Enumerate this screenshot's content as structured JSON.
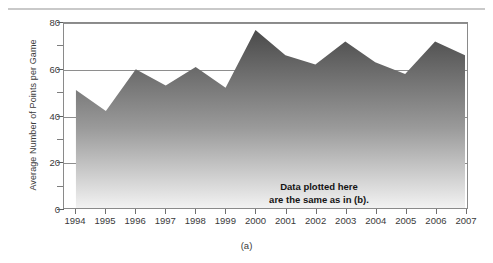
{
  "figure": {
    "caption": "(a)",
    "annotation_lines": [
      "Data plotted here",
      "are the same as in (b).",
      "Looks different, doesn't it?"
    ]
  },
  "chart_data": {
    "type": "area",
    "title": "",
    "xlabel": "",
    "ylabel": "Average Number of Points per Game",
    "categories": [
      "1994",
      "1995",
      "1996",
      "1997",
      "1998",
      "1999",
      "2000",
      "2001",
      "2002",
      "2003",
      "2004",
      "2005",
      "2006",
      "2007"
    ],
    "values": [
      51,
      42,
      60,
      53,
      61,
      52,
      77,
      66,
      62,
      72,
      63,
      58,
      72,
      66
    ],
    "ylim": [
      0,
      80
    ],
    "y_tick_labels": [
      "0",
      "20",
      "40",
      "60",
      "80"
    ],
    "y_ticks": [
      0,
      20,
      40,
      60,
      80
    ],
    "y_minor_ticks": [
      10,
      30,
      50,
      70
    ],
    "gridlines": [
      20,
      40,
      60,
      80
    ],
    "grid": true,
    "legend": "none",
    "series_fill_top_color": "#4a4a4a",
    "series_fill_bottom_color": "#f2f2f2",
    "axis_color": "#8a8a8a"
  }
}
